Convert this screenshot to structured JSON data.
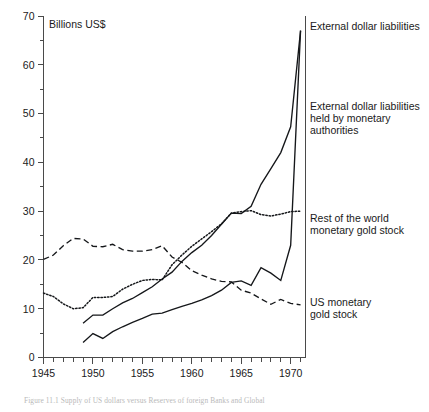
{
  "figure": {
    "unit_label": "Billions US$",
    "caption": "Figure 11.1 Supply of US dollars versus Reserves of foreign Banks and Global"
  },
  "chart_data": {
    "type": "line",
    "title": "",
    "subtitle": "",
    "xlabel": "",
    "ylabel": "Billions US$",
    "xlim": [
      1945,
      1971.5
    ],
    "ylim": [
      0,
      70
    ],
    "grid": false,
    "legend_position": "right-inline-labels",
    "y_ticks_major": [
      0,
      10,
      20,
      30,
      40,
      50,
      60,
      70
    ],
    "y_ticks_minor": [
      5,
      15,
      25,
      35,
      45,
      55,
      65
    ],
    "y_tick_labels": [
      "0",
      "10",
      "20",
      "30",
      "40",
      "50",
      "60",
      "70"
    ],
    "x_ticks_major": [
      1945,
      1950,
      1955,
      1960,
      1965,
      1970
    ],
    "x_tick_labels": [
      "1945",
      "1950",
      "1955",
      "1960",
      "1965",
      "1970"
    ],
    "x_ticks_all": [
      1945,
      1946,
      1947,
      1948,
      1949,
      1950,
      1951,
      1952,
      1953,
      1954,
      1955,
      1956,
      1957,
      1958,
      1959,
      1960,
      1961,
      1962,
      1963,
      1964,
      1965,
      1966,
      1967,
      1968,
      1969,
      1970,
      1971
    ],
    "series": [
      {
        "name": "External dollar liabilities",
        "style": "solid",
        "label_lines": [
          "External dollar liabilities"
        ],
        "x": [
          1949,
          1950,
          1951,
          1952,
          1953,
          1954,
          1955,
          1956,
          1957,
          1958,
          1959,
          1960,
          1961,
          1962,
          1963,
          1964,
          1965,
          1966,
          1967,
          1968,
          1969,
          1970,
          1971
        ],
        "values": [
          7.0,
          8.7,
          8.7,
          10.0,
          11.2,
          12.1,
          13.3,
          14.5,
          16.1,
          17.5,
          19.7,
          21.5,
          23.0,
          25.0,
          27.3,
          29.6,
          29.5,
          31.0,
          35.5,
          38.7,
          42.0,
          47.3,
          67.0
        ]
      },
      {
        "name": "External dollar liabilities held by monetary authorities",
        "style": "solid",
        "label_lines": [
          "External dollar liabilities",
          "held by monetary",
          "authorities"
        ],
        "x": [
          1949,
          1950,
          1951,
          1952,
          1953,
          1954,
          1955,
          1956,
          1957,
          1958,
          1959,
          1960,
          1961,
          1962,
          1963,
          1964,
          1965,
          1966,
          1967,
          1968,
          1969,
          1970,
          1971
        ],
        "values": [
          3.1,
          4.9,
          3.9,
          5.3,
          6.3,
          7.2,
          8.0,
          8.9,
          9.1,
          9.8,
          10.5,
          11.1,
          11.8,
          12.7,
          13.8,
          15.4,
          15.7,
          14.8,
          18.4,
          17.3,
          15.8,
          23.0,
          67.0
        ]
      },
      {
        "name": "Rest of the world monetary gold stock",
        "style": "dotted",
        "label_lines": [
          "Rest of the world",
          "monetary gold stock"
        ],
        "x": [
          1945,
          1946,
          1947,
          1948,
          1949,
          1950,
          1951,
          1952,
          1953,
          1954,
          1955,
          1956,
          1957,
          1958,
          1959,
          1960,
          1961,
          1962,
          1963,
          1964,
          1965,
          1966,
          1967,
          1968,
          1969,
          1970,
          1971
        ],
        "values": [
          13.2,
          12.5,
          11.0,
          10.0,
          10.2,
          12.3,
          12.3,
          12.5,
          14.0,
          15.0,
          15.8,
          16.0,
          15.9,
          19.0,
          21.0,
          22.8,
          24.3,
          25.8,
          27.4,
          29.6,
          29.9,
          30.1,
          29.3,
          29.0,
          29.4,
          29.9,
          30.0
        ]
      },
      {
        "name": "US monetary gold stock",
        "style": "dashed",
        "label_lines": [
          "US monetary",
          "gold stock"
        ],
        "x": [
          1945,
          1946,
          1947,
          1948,
          1949,
          1950,
          1951,
          1952,
          1953,
          1954,
          1955,
          1956,
          1957,
          1958,
          1959,
          1960,
          1961,
          1962,
          1963,
          1964,
          1965,
          1966,
          1967,
          1968,
          1969,
          1970,
          1971
        ],
        "values": [
          20.1,
          21.0,
          22.9,
          24.4,
          24.3,
          22.8,
          22.7,
          23.2,
          22.1,
          21.8,
          21.8,
          22.1,
          22.9,
          20.6,
          19.5,
          17.8,
          16.9,
          16.1,
          15.6,
          15.5,
          13.8,
          13.2,
          12.0,
          10.9,
          11.9,
          11.1,
          10.8
        ]
      }
    ],
    "annotations": [
      {
        "text": "Billions US$",
        "x": 1945.6,
        "y": 68.0
      }
    ]
  }
}
